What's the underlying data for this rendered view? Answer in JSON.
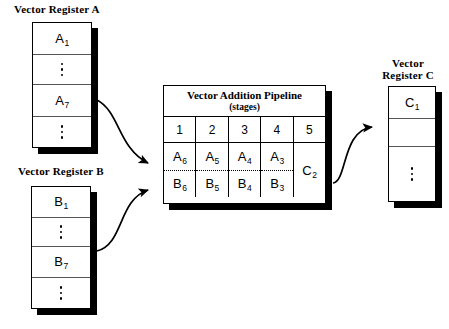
{
  "register_a": {
    "label": "Vector Register A",
    "cells": [
      {
        "type": "value",
        "base": "A",
        "sub": "1"
      },
      {
        "type": "dots",
        "base": "",
        "sub": ""
      },
      {
        "type": "value",
        "base": "A",
        "sub": "7"
      },
      {
        "type": "dots",
        "base": "",
        "sub": ""
      }
    ]
  },
  "register_b": {
    "label": "Vector Register B",
    "cells": [
      {
        "type": "value",
        "base": "B",
        "sub": "1"
      },
      {
        "type": "dots",
        "base": "",
        "sub": ""
      },
      {
        "type": "value",
        "base": "B",
        "sub": "7"
      },
      {
        "type": "dots",
        "base": "",
        "sub": ""
      }
    ]
  },
  "register_c": {
    "label_line1": "Vector",
    "label_line2": "Register C",
    "cells": [
      {
        "type": "value",
        "base": "C",
        "sub": "1"
      },
      {
        "type": "empty",
        "base": "",
        "sub": ""
      },
      {
        "type": "dots",
        "base": "",
        "sub": ""
      }
    ]
  },
  "pipeline": {
    "title": "Vector Addition Pipeline",
    "subtitle": "(stages)",
    "stages": [
      "1",
      "2",
      "3",
      "4",
      "5"
    ],
    "columns": [
      {
        "stage": "1",
        "top": {
          "base": "A",
          "sub": "6"
        },
        "bottom": {
          "base": "B",
          "sub": "6"
        },
        "merged": false
      },
      {
        "stage": "2",
        "top": {
          "base": "A",
          "sub": "5"
        },
        "bottom": {
          "base": "B",
          "sub": "5"
        },
        "merged": false
      },
      {
        "stage": "3",
        "top": {
          "base": "A",
          "sub": "4"
        },
        "bottom": {
          "base": "B",
          "sub": "4"
        },
        "merged": false
      },
      {
        "stage": "4",
        "top": {
          "base": "A",
          "sub": "3"
        },
        "bottom": {
          "base": "B",
          "sub": "3"
        },
        "merged": false
      },
      {
        "stage": "5",
        "merged": true,
        "result": {
          "base": "C",
          "sub": "2"
        }
      }
    ]
  },
  "arrows": {
    "a_to_pipeline": "arrow-a-input",
    "b_to_pipeline": "arrow-b-input",
    "pipeline_to_c": "arrow-c-output"
  },
  "colors": {
    "stroke": "#000000",
    "background": "#ffffff",
    "cell_divider": "#555555"
  }
}
